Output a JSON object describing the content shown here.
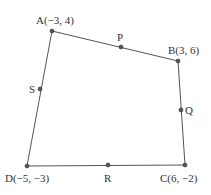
{
  "diagram": {
    "type": "quadrilateral",
    "colors": {
      "stroke": "#555555",
      "point": "#555555",
      "text": "#333333"
    },
    "vertices": [
      {
        "id": "A",
        "label": "A(−3, 4)",
        "x": 52,
        "y": 31,
        "lx": 36,
        "ly": 24,
        "anchor": "start"
      },
      {
        "id": "B",
        "label": "B(3, 6)",
        "x": 178,
        "y": 61,
        "lx": 168,
        "ly": 54,
        "anchor": "start"
      },
      {
        "id": "C",
        "label": "C(6, −2)",
        "x": 185,
        "y": 165,
        "lx": 160,
        "ly": 182,
        "anchor": "start"
      },
      {
        "id": "D",
        "label": "D(−5, −3)",
        "x": 27,
        "y": 166,
        "lx": 5,
        "ly": 182,
        "anchor": "start"
      }
    ],
    "midpoints": [
      {
        "id": "P",
        "label": "P",
        "x": 121,
        "y": 47,
        "lx": 117,
        "ly": 41,
        "anchor": "start",
        "between": "AB"
      },
      {
        "id": "Q",
        "label": "Q",
        "x": 181,
        "y": 110,
        "lx": 185,
        "ly": 114,
        "anchor": "start",
        "between": "BC"
      },
      {
        "id": "R",
        "label": "R",
        "x": 108,
        "y": 165,
        "lx": 104,
        "ly": 182,
        "anchor": "start",
        "between": "CD"
      },
      {
        "id": "S",
        "label": "S",
        "x": 40,
        "y": 89,
        "lx": 29,
        "ly": 93,
        "anchor": "start",
        "between": "DA"
      }
    ]
  }
}
